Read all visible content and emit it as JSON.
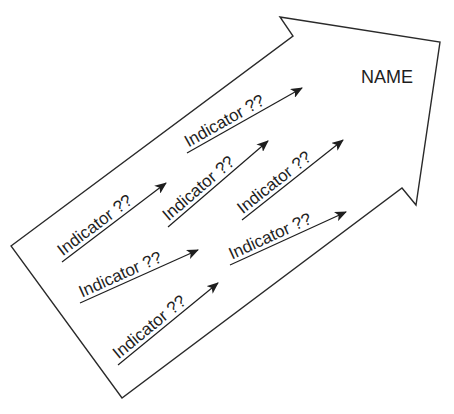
{
  "diagram": {
    "title": "NAME",
    "shape": "block-arrow",
    "stroke_color": "#2a2a2a",
    "fill_color": "#ffffff",
    "indicators": [
      {
        "label": "Indicator ??",
        "x1": 187,
        "y1": 153,
        "x2": 302,
        "y2": 88
      },
      {
        "label": "Indicator ??",
        "x1": 62,
        "y1": 262,
        "x2": 166,
        "y2": 183
      },
      {
        "label": "Indicator ??",
        "x1": 168,
        "y1": 227,
        "x2": 268,
        "y2": 141
      },
      {
        "label": "Indicator ??",
        "x1": 242,
        "y1": 220,
        "x2": 343,
        "y2": 140
      },
      {
        "label": "Indicator ??",
        "x1": 80,
        "y1": 303,
        "x2": 198,
        "y2": 250
      },
      {
        "label": "Indicator ??",
        "x1": 230,
        "y1": 265,
        "x2": 346,
        "y2": 212
      },
      {
        "label": "Indicator ??",
        "x1": 118,
        "y1": 365,
        "x2": 218,
        "y2": 283
      }
    ]
  }
}
